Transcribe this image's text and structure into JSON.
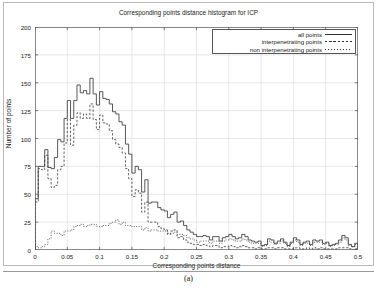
{
  "figure": {
    "caption": "(a)"
  },
  "chart_data": {
    "type": "line",
    "title": "Corresponding points distance histogram for ICP",
    "xlabel": "Corresponding points distance",
    "ylabel": "Number of points",
    "xlim": [
      0,
      0.5
    ],
    "ylim": [
      0,
      200
    ],
    "xticks": [
      0,
      0.05,
      0.1,
      0.15,
      0.2,
      0.25,
      0.3,
      0.35,
      0.4,
      0.45,
      0.5
    ],
    "xtick_labels": [
      "0",
      "0.05",
      "0.1",
      "0.15",
      "0.2",
      "0.25",
      "0.3",
      "0.35",
      "0.4",
      "0.45",
      "0.5"
    ],
    "yticks": [
      0,
      25,
      50,
      75,
      100,
      125,
      150,
      175,
      200
    ],
    "ytick_labels": [
      "0",
      "25",
      "50",
      "75",
      "100",
      "125",
      "150",
      "175",
      "200"
    ],
    "grid": true,
    "legend_position": "top-right",
    "bin_width": 0.005,
    "x": [
      0.0025,
      0.0075,
      0.0125,
      0.0175,
      0.0225,
      0.0275,
      0.0325,
      0.0375,
      0.0425,
      0.0475,
      0.0525,
      0.0575,
      0.0625,
      0.0675,
      0.0725,
      0.0775,
      0.0825,
      0.0875,
      0.0925,
      0.0975,
      0.1025,
      0.1075,
      0.1125,
      0.1175,
      0.1225,
      0.1275,
      0.1325,
      0.1375,
      0.1425,
      0.1475,
      0.1525,
      0.1575,
      0.1625,
      0.1675,
      0.1725,
      0.1775,
      0.1825,
      0.1875,
      0.1925,
      0.1975,
      0.2025,
      0.2075,
      0.2125,
      0.2175,
      0.2225,
      0.2275,
      0.2325,
      0.2375,
      0.2425,
      0.2475,
      0.2525,
      0.2575,
      0.2625,
      0.2675,
      0.2725,
      0.2775,
      0.2825,
      0.2875,
      0.2925,
      0.2975,
      0.3025,
      0.3075,
      0.3125,
      0.3175,
      0.3225,
      0.3275,
      0.3325,
      0.3375,
      0.3425,
      0.3475,
      0.3525,
      0.3575,
      0.3625,
      0.3675,
      0.3725,
      0.3775,
      0.3825,
      0.3875,
      0.3925,
      0.3975,
      0.4025,
      0.4075,
      0.4125,
      0.4175,
      0.4225,
      0.4275,
      0.4325,
      0.4375,
      0.4425,
      0.4475,
      0.4525,
      0.4575,
      0.4625,
      0.4675,
      0.4725,
      0.4775,
      0.4825,
      0.4875,
      0.4925,
      0.4975
    ],
    "series": [
      {
        "name": "all points",
        "style": "solid",
        "values": [
          46,
          75,
          75,
          90,
          74,
          73,
          83,
          99,
          97,
          118,
          134,
          118,
          134,
          148,
          141,
          143,
          140,
          154,
          140,
          130,
          142,
          136,
          135,
          131,
          124,
          122,
          115,
          112,
          95,
          86,
          69,
          75,
          72,
          52,
          63,
          42,
          43,
          43,
          38,
          36,
          35,
          29,
          32,
          34,
          25,
          26,
          22,
          18,
          16,
          14,
          12,
          12,
          13,
          12,
          9,
          12,
          12,
          8,
          11,
          12,
          14,
          12,
          10,
          11,
          14,
          12,
          9,
          8,
          7,
          8,
          4,
          5,
          10,
          9,
          6,
          8,
          10,
          7,
          4,
          7,
          11,
          9,
          5,
          7,
          8,
          5,
          9,
          8,
          9,
          6,
          7,
          4,
          5,
          6,
          9,
          13,
          11,
          5,
          3,
          6
        ]
      },
      {
        "name": "interpenetrating points",
        "style": "dashed",
        "values": [
          43,
          73,
          72,
          85,
          64,
          56,
          58,
          72,
          75,
          96,
          117,
          94,
          112,
          123,
          118,
          122,
          118,
          131,
          117,
          108,
          121,
          114,
          113,
          107,
          99,
          95,
          92,
          87,
          73,
          64,
          48,
          54,
          51,
          34,
          43,
          25,
          25,
          25,
          21,
          19,
          18,
          14,
          17,
          18,
          11,
          12,
          9,
          7,
          6,
          5,
          5,
          4,
          5,
          4,
          3,
          4,
          4,
          2,
          3,
          3,
          4,
          3,
          2,
          3,
          4,
          3,
          2,
          2,
          1,
          2,
          1,
          1,
          2,
          2,
          1,
          2,
          2,
          1,
          1,
          1,
          2,
          2,
          1,
          1,
          2,
          1,
          2,
          1,
          2,
          1,
          1,
          1,
          1,
          1,
          2,
          2,
          2,
          1,
          0,
          1
        ]
      },
      {
        "name": "non interpenetrating points",
        "style": "dotted",
        "values": [
          3,
          2,
          3,
          5,
          10,
          17,
          15,
          15,
          13,
          17,
          17,
          18,
          21,
          22,
          23,
          21,
          22,
          23,
          23,
          21,
          21,
          22,
          22,
          24,
          25,
          27,
          23,
          25,
          22,
          22,
          21,
          21,
          21,
          18,
          20,
          17,
          18,
          18,
          17,
          17,
          17,
          15,
          15,
          16,
          14,
          14,
          13,
          11,
          10,
          9,
          7,
          8,
          8,
          8,
          6,
          8,
          8,
          6,
          8,
          9,
          10,
          9,
          8,
          8,
          10,
          9,
          7,
          6,
          6,
          6,
          3,
          4,
          8,
          7,
          5,
          6,
          8,
          6,
          3,
          6,
          9,
          7,
          4,
          6,
          6,
          4,
          7,
          7,
          7,
          5,
          6,
          3,
          4,
          5,
          7,
          11,
          9,
          4,
          3,
          5
        ]
      }
    ]
  }
}
